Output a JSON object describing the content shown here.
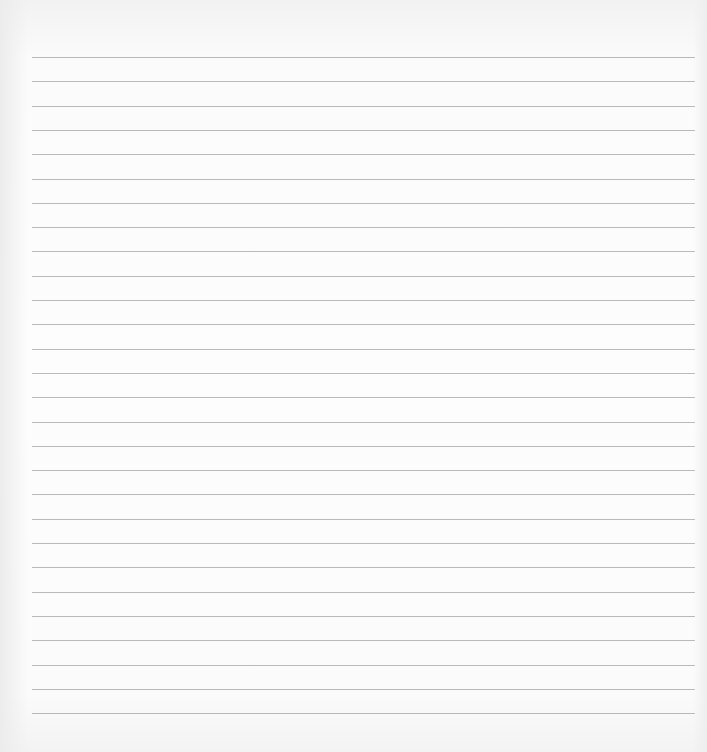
{
  "paper": {
    "type": "lined-paper",
    "background_color": "#fcfcfc",
    "line_color": "#a9a9a9",
    "line_count": 28,
    "first_line_y": 57,
    "line_spacing": 24.3,
    "line_left": 32,
    "line_right_margin": 12
  }
}
